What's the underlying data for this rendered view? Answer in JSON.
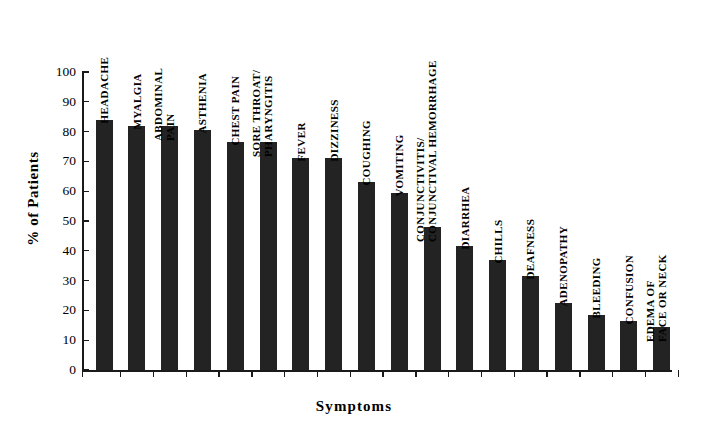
{
  "chart_data": {
    "type": "bar",
    "title": "",
    "xlabel": "Symptoms",
    "ylabel": "% of Patients",
    "ylim": [
      0,
      100
    ],
    "yticks": [
      0,
      10,
      20,
      30,
      40,
      50,
      60,
      70,
      80,
      90,
      100
    ],
    "grid": false,
    "legend": false,
    "bar_color": "#232323",
    "axis_color": "#1a1a1a",
    "background": "#ffffff",
    "categories": [
      "HEADACHE",
      "MYALGIA",
      "ABDOMINAL\nPAIN",
      "ASTHENIA",
      "CHEST PAIN",
      "SORE THROAT/\nPHARYNGITIS",
      "FEVER",
      "DIZZINESS",
      "COUGHING",
      "VOMITING",
      "CONJUNCTIVITIS/\nCONJUNCTIVAL HEMORRHAGE",
      "DIARRHEA",
      "CHILLS",
      "DEAFNESS",
      "ADENOPATHY",
      "BLEEDING",
      "CONFUSION",
      "EDEMA OF\nFACE OR NECK"
    ],
    "values": [
      84,
      82,
      82,
      80.5,
      76.5,
      76.5,
      71,
      71,
      63,
      59.5,
      48,
      41.5,
      37,
      31.5,
      22.5,
      18.5,
      16.5,
      14.5
    ]
  }
}
